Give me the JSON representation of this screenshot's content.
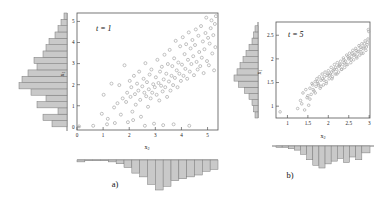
{
  "figure": {
    "caption_a": "a)",
    "caption_b": "b)"
  },
  "chart_data": [
    {
      "id": "panel-a",
      "type": "scatter",
      "title": "t = 1",
      "xlabel": "x2",
      "ylabel": "x1",
      "xlim": [
        0,
        5.4
      ],
      "ylim": [
        -0.15,
        5.4
      ],
      "xticks": [
        0,
        1,
        2,
        3,
        4,
        5
      ],
      "yticks": [
        0,
        1,
        2,
        3,
        4,
        5
      ],
      "grid": false,
      "marker": "open-circle",
      "points": [
        [
          0.08,
          0.02
        ],
        [
          0.62,
          0.05
        ],
        [
          1.02,
          1.52
        ],
        [
          1.18,
          0.38
        ],
        [
          1.32,
          2.05
        ],
        [
          1.42,
          0.92
        ],
        [
          1.55,
          1.12
        ],
        [
          1.62,
          1.98
        ],
        [
          1.68,
          0.58
        ],
        [
          1.75,
          1.35
        ],
        [
          1.82,
          2.92
        ],
        [
          1.88,
          1.18
        ],
        [
          1.92,
          1.62
        ],
        [
          1.95,
          0.22
        ],
        [
          2.02,
          2.18
        ],
        [
          2.05,
          1.42
        ],
        [
          2.08,
          1.88
        ],
        [
          2.12,
          0.72
        ],
        [
          2.18,
          2.42
        ],
        [
          2.22,
          1.55
        ],
        [
          2.25,
          1.05
        ],
        [
          2.3,
          2.05
        ],
        [
          2.35,
          1.72
        ],
        [
          2.38,
          2.62
        ],
        [
          2.42,
          1.28
        ],
        [
          2.45,
          0.48
        ],
        [
          2.5,
          1.92
        ],
        [
          2.55,
          2.28
        ],
        [
          2.58,
          1.62
        ],
        [
          2.62,
          3.02
        ],
        [
          2.65,
          1.45
        ],
        [
          2.68,
          2.12
        ],
        [
          2.72,
          0.95
        ],
        [
          2.75,
          1.78
        ],
        [
          2.78,
          2.48
        ],
        [
          2.82,
          1.35
        ],
        [
          2.85,
          2.72
        ],
        [
          2.88,
          1.62
        ],
        [
          2.92,
          2.02
        ],
        [
          2.95,
          0.15
        ],
        [
          2.98,
          1.88
        ],
        [
          3.02,
          2.35
        ],
        [
          3.05,
          1.52
        ],
        [
          3.08,
          3.18
        ],
        [
          3.12,
          2.08
        ],
        [
          3.15,
          1.25
        ],
        [
          3.18,
          2.62
        ],
        [
          3.22,
          1.95
        ],
        [
          3.25,
          2.85
        ],
        [
          3.28,
          1.68
        ],
        [
          3.32,
          2.25
        ],
        [
          3.35,
          3.42
        ],
        [
          3.38,
          1.88
        ],
        [
          3.42,
          2.52
        ],
        [
          3.45,
          1.42
        ],
        [
          3.48,
          2.98
        ],
        [
          3.52,
          2.15
        ],
        [
          3.55,
          3.65
        ],
        [
          3.58,
          1.72
        ],
        [
          3.62,
          2.42
        ],
        [
          3.65,
          2.88
        ],
        [
          3.68,
          1.98
        ],
        [
          3.72,
          3.25
        ],
        [
          3.75,
          2.32
        ],
        [
          3.78,
          4.08
        ],
        [
          3.82,
          2.68
        ],
        [
          3.85,
          1.88
        ],
        [
          3.88,
          3.05
        ],
        [
          3.92,
          2.52
        ],
        [
          3.95,
          3.82
        ],
        [
          3.98,
          2.18
        ],
        [
          4.02,
          2.95
        ],
        [
          4.05,
          4.25
        ],
        [
          4.08,
          2.42
        ],
        [
          4.12,
          3.45
        ],
        [
          4.15,
          2.75
        ],
        [
          4.18,
          3.92
        ],
        [
          4.22,
          2.28
        ],
        [
          4.25,
          3.18
        ],
        [
          4.28,
          4.48
        ],
        [
          4.32,
          2.62
        ],
        [
          4.35,
          3.72
        ],
        [
          4.38,
          2.98
        ],
        [
          4.42,
          4.12
        ],
        [
          4.45,
          3.35
        ],
        [
          4.48,
          2.45
        ],
        [
          4.52,
          3.88
        ],
        [
          4.55,
          4.62
        ],
        [
          4.58,
          3.08
        ],
        [
          4.62,
          2.72
        ],
        [
          4.65,
          4.32
        ],
        [
          4.68,
          3.55
        ],
        [
          4.72,
          2.88
        ],
        [
          4.75,
          4.78
        ],
        [
          4.78,
          3.28
        ],
        [
          4.82,
          4.05
        ],
        [
          4.85,
          2.55
        ],
        [
          4.88,
          3.68
        ],
        [
          4.92,
          4.45
        ],
        [
          4.95,
          5.18
        ],
        [
          4.98,
          3.12
        ],
        [
          5.02,
          4.22
        ],
        [
          5.05,
          2.92
        ],
        [
          5.08,
          3.95
        ],
        [
          5.12,
          4.68
        ],
        [
          5.15,
          5.05
        ],
        [
          5.18,
          3.48
        ],
        [
          5.22,
          4.35
        ],
        [
          5.25,
          2.68
        ],
        [
          5.28,
          4.88
        ],
        [
          5.3,
          3.78
        ],
        [
          5.32,
          5.25
        ],
        [
          2.6,
          0.05
        ],
        [
          3.3,
          0.08
        ],
        [
          1.15,
          0.12
        ],
        [
          4.3,
          0.05
        ],
        [
          2.15,
          0.32
        ],
        [
          0.95,
          0.62
        ],
        [
          1.45,
          0.18
        ],
        [
          3.7,
          0.12
        ]
      ],
      "hist_y": {
        "orientation": "horizontal",
        "bins": [
          0.0,
          0.3,
          0.6,
          0.9,
          1.2,
          1.5,
          1.8,
          2.1,
          2.4,
          2.7,
          3.0,
          3.3,
          3.6,
          3.9,
          4.2,
          4.5,
          4.8,
          5.1,
          5.4
        ],
        "counts": [
          5,
          8,
          3,
          10,
          7,
          12,
          16,
          15,
          13,
          10,
          11,
          8,
          7,
          6,
          4,
          3,
          2,
          1
        ]
      },
      "hist_x": {
        "orientation": "vertical-down",
        "bins": [
          0.0,
          0.3,
          0.6,
          0.9,
          1.2,
          1.5,
          1.8,
          2.1,
          2.4,
          2.7,
          3.0,
          3.3,
          3.6,
          3.9,
          4.2,
          4.5,
          4.8,
          5.1,
          5.4
        ],
        "counts": [
          1,
          0,
          0,
          0,
          1,
          2,
          4,
          7,
          9,
          13,
          16,
          14,
          11,
          10,
          9,
          8,
          6,
          5
        ]
      }
    },
    {
      "id": "panel-b",
      "type": "scatter",
      "title": "t = 5",
      "xlabel": "x2",
      "ylabel": "x1",
      "xlim": [
        0.72,
        3.02
      ],
      "ylim": [
        0.75,
        2.78
      ],
      "xticks": [
        1,
        1.5,
        2,
        2.5,
        3
      ],
      "yticks": [
        1,
        1.5,
        2,
        2.5
      ],
      "grid": false,
      "marker": "open-circle",
      "points": [
        [
          0.82,
          0.88
        ],
        [
          1.32,
          1.12
        ],
        [
          1.42,
          0.92
        ],
        [
          1.48,
          1.18
        ],
        [
          1.52,
          1.02
        ],
        [
          1.55,
          1.38
        ],
        [
          1.58,
          1.25
        ],
        [
          1.62,
          1.45
        ],
        [
          1.65,
          1.32
        ],
        [
          1.68,
          1.52
        ],
        [
          1.7,
          1.42
        ],
        [
          1.72,
          1.58
        ],
        [
          1.75,
          1.48
        ],
        [
          1.78,
          1.62
        ],
        [
          1.8,
          1.38
        ],
        [
          1.82,
          1.55
        ],
        [
          1.85,
          1.68
        ],
        [
          1.88,
          1.45
        ],
        [
          1.9,
          1.62
        ],
        [
          1.92,
          1.72
        ],
        [
          1.95,
          1.52
        ],
        [
          1.97,
          1.65
        ],
        [
          2.0,
          1.75
        ],
        [
          2.02,
          1.58
        ],
        [
          2.05,
          1.68
        ],
        [
          2.07,
          1.82
        ],
        [
          2.1,
          1.62
        ],
        [
          2.12,
          1.75
        ],
        [
          2.15,
          1.88
        ],
        [
          2.17,
          1.68
        ],
        [
          2.2,
          1.78
        ],
        [
          2.22,
          1.92
        ],
        [
          2.25,
          1.72
        ],
        [
          2.27,
          1.85
        ],
        [
          2.3,
          1.95
        ],
        [
          2.32,
          1.78
        ],
        [
          2.35,
          1.88
        ],
        [
          2.37,
          2.02
        ],
        [
          2.4,
          1.82
        ],
        [
          2.42,
          1.95
        ],
        [
          2.45,
          2.08
        ],
        [
          2.47,
          1.88
        ],
        [
          2.5,
          2.0
        ],
        [
          2.52,
          2.12
        ],
        [
          2.55,
          1.92
        ],
        [
          2.57,
          2.05
        ],
        [
          2.6,
          2.18
        ],
        [
          2.62,
          1.98
        ],
        [
          2.65,
          2.1
        ],
        [
          2.67,
          2.22
        ],
        [
          2.7,
          2.02
        ],
        [
          2.72,
          2.15
        ],
        [
          2.75,
          2.28
        ],
        [
          2.77,
          2.08
        ],
        [
          2.8,
          2.2
        ],
        [
          2.82,
          2.32
        ],
        [
          2.85,
          2.12
        ],
        [
          2.87,
          2.25
        ],
        [
          2.9,
          2.38
        ],
        [
          2.92,
          2.18
        ],
        [
          2.95,
          2.3
        ],
        [
          2.97,
          2.42
        ],
        [
          1.38,
          1.28
        ],
        [
          1.45,
          1.35
        ],
        [
          1.6,
          1.48
        ],
        [
          1.73,
          1.52
        ],
        [
          1.86,
          1.58
        ],
        [
          1.99,
          1.68
        ],
        [
          2.08,
          1.72
        ],
        [
          2.18,
          1.82
        ],
        [
          2.28,
          1.88
        ],
        [
          2.38,
          1.98
        ],
        [
          2.48,
          2.05
        ],
        [
          2.58,
          2.12
        ],
        [
          2.68,
          2.18
        ],
        [
          2.78,
          2.25
        ],
        [
          2.88,
          2.32
        ],
        [
          2.98,
          2.62
        ],
        [
          2.99,
          2.58
        ],
        [
          1.25,
          0.95
        ],
        [
          1.35,
          1.05
        ],
        [
          1.5,
          1.22
        ],
        [
          1.63,
          1.35
        ],
        [
          1.76,
          1.45
        ],
        [
          1.89,
          1.55
        ],
        [
          2.03,
          1.65
        ],
        [
          2.14,
          1.78
        ],
        [
          2.26,
          1.85
        ],
        [
          2.39,
          1.92
        ],
        [
          2.51,
          2.02
        ],
        [
          2.63,
          2.08
        ],
        [
          2.74,
          2.16
        ],
        [
          2.86,
          2.22
        ],
        [
          2.96,
          2.35
        ],
        [
          1.55,
          1.15
        ],
        [
          1.68,
          1.28
        ],
        [
          1.82,
          1.42
        ],
        [
          1.95,
          1.48
        ],
        [
          2.09,
          1.58
        ],
        [
          2.21,
          1.68
        ],
        [
          2.33,
          1.78
        ],
        [
          2.44,
          1.88
        ],
        [
          2.56,
          1.98
        ],
        [
          2.69,
          2.05
        ],
        [
          2.81,
          2.12
        ],
        [
          2.93,
          2.25
        ]
      ],
      "hist_y": {
        "orientation": "horizontal",
        "bins": [
          0.75,
          0.88,
          1.01,
          1.14,
          1.27,
          1.4,
          1.53,
          1.66,
          1.79,
          1.92,
          2.05,
          2.18,
          2.31,
          2.44,
          2.57,
          2.7
        ],
        "counts": [
          2,
          3,
          4,
          6,
          9,
          13,
          16,
          14,
          12,
          10,
          8,
          6,
          4,
          3,
          2
        ]
      },
      "hist_x": {
        "orientation": "vertical-down",
        "bins": [
          0.72,
          0.87,
          1.02,
          1.17,
          1.32,
          1.47,
          1.62,
          1.77,
          1.92,
          2.07,
          2.22,
          2.37,
          2.52,
          2.67,
          2.82,
          3.02
        ],
        "counts": [
          1,
          1,
          2,
          3,
          6,
          10,
          14,
          16,
          13,
          11,
          9,
          12,
          8,
          10,
          5
        ]
      }
    }
  ]
}
